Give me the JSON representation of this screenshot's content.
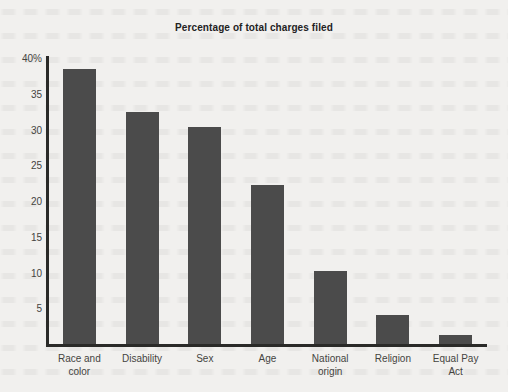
{
  "chart_data": {
    "type": "bar",
    "title": "Percentage of total charges filed",
    "xlabel": "",
    "ylabel": "",
    "categories": [
      "Race and color",
      "Disability",
      "Sex",
      "Age",
      "National origin",
      "Religion",
      "Equal Pay Act"
    ],
    "values": [
      38.5,
      32.5,
      30.4,
      22.3,
      10.2,
      4.1,
      1.2
    ],
    "ylim": [
      0,
      40
    ],
    "yticks": [
      5,
      10,
      15,
      20,
      25,
      30,
      35,
      40
    ],
    "ytick_labels": [
      "5",
      "10",
      "15",
      "20",
      "25",
      "30",
      "35",
      "40%"
    ],
    "grid": false,
    "legend": false,
    "bar_color": "#4b4b4b",
    "axis_color": "#2a2a28",
    "background_color": "#f1f0ee"
  },
  "axis": {
    "y_labels": [
      {
        "value": 40,
        "text": "40%"
      },
      {
        "value": 35,
        "text": "35"
      },
      {
        "value": 30,
        "text": "30"
      },
      {
        "value": 25,
        "text": "25"
      },
      {
        "value": 20,
        "text": "20"
      },
      {
        "value": 15,
        "text": "15"
      },
      {
        "value": 10,
        "text": "10"
      },
      {
        "value": 5,
        "text": "5"
      }
    ],
    "x_labels": [
      {
        "line1": "Race and",
        "line2": "color"
      },
      {
        "line1": "Disability",
        "line2": ""
      },
      {
        "line1": "Sex",
        "line2": ""
      },
      {
        "line1": "Age",
        "line2": ""
      },
      {
        "line1": "National",
        "line2": "origin"
      },
      {
        "line1": "Religion",
        "line2": ""
      },
      {
        "line1": "Equal Pay",
        "line2": "Act"
      }
    ]
  }
}
